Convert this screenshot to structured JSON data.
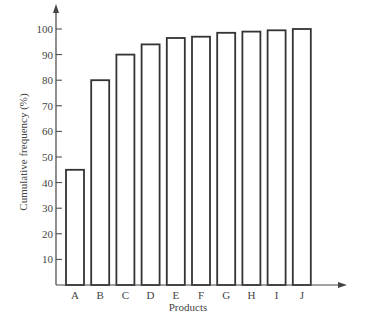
{
  "chart_data": {
    "type": "bar",
    "title": "",
    "xlabel": "Products",
    "ylabel": "Cumulative frequency (%)",
    "categories": [
      "A",
      "B",
      "C",
      "D",
      "E",
      "F",
      "G",
      "H",
      "I",
      "J"
    ],
    "values": [
      45,
      80,
      90,
      94,
      96.5,
      97,
      98.5,
      99,
      99.5,
      100
    ],
    "ylim": [
      0,
      100
    ],
    "yticks": [
      10,
      20,
      30,
      40,
      50,
      60,
      70,
      80,
      90,
      100
    ],
    "grid": false,
    "legend": null,
    "bar_style": "outline"
  },
  "colors": {
    "bar_fill": "#ffffff",
    "bar_stroke": "#333333",
    "axis": "#444444"
  }
}
